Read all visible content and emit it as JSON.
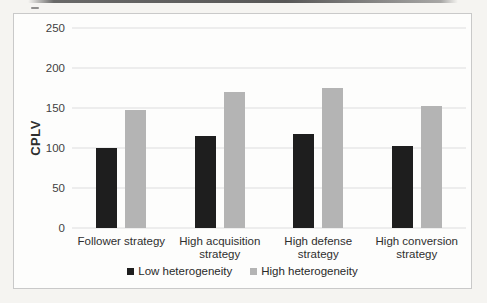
{
  "figure": {
    "background_color": "#f5f4f1",
    "frame_background": "#fdfdfc",
    "frame_border_color": "#c9c9c9"
  },
  "chart_data": {
    "type": "bar",
    "title": "",
    "xlabel": "",
    "ylabel": "CPLV",
    "categories": [
      "Follower strategy",
      "High acquisition strategy",
      "High defense strategy",
      "High conversion strategy"
    ],
    "series": [
      {
        "name": "Low heterogeneity",
        "color": "#1e1e1e",
        "values": [
          100,
          115,
          118,
          103
        ]
      },
      {
        "name": "High heterogeneity",
        "color": "#b4b4b4",
        "values": [
          148,
          170,
          175,
          153
        ]
      }
    ],
    "ylim": [
      0,
      250
    ],
    "yticks": [
      0,
      50,
      100,
      150,
      200,
      250
    ],
    "grid": "horizontal",
    "gridline_color": "#dedede",
    "legend_position": "bottom",
    "axis_text_color": "#3f3f3f"
  }
}
